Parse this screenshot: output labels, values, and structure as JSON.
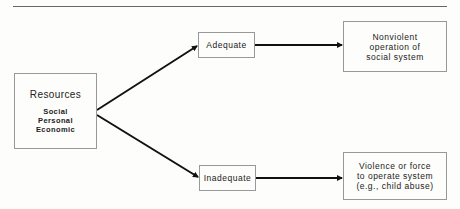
{
  "diagram": {
    "type": "flow",
    "nodes": {
      "resources": {
        "title": "Resources",
        "items": [
          "Social",
          "Personal",
          "Economic"
        ]
      },
      "adequate": {
        "label": "Adequate"
      },
      "inadequate": {
        "label": "Inadequate"
      },
      "nonviolent": {
        "lines": [
          "Nonviolent",
          "operation of",
          "social system"
        ]
      },
      "violence": {
        "lines": [
          "Violence or force",
          "to operate system",
          "(e.g., child abuse)"
        ]
      }
    },
    "edges": [
      {
        "from": "resources",
        "to": "adequate"
      },
      {
        "from": "resources",
        "to": "inadequate"
      },
      {
        "from": "adequate",
        "to": "nonviolent"
      },
      {
        "from": "inadequate",
        "to": "violence"
      }
    ],
    "colors": {
      "line": "#111111",
      "box_border": "#999999",
      "rule": "#666666",
      "background": "#fdfdfb"
    }
  }
}
